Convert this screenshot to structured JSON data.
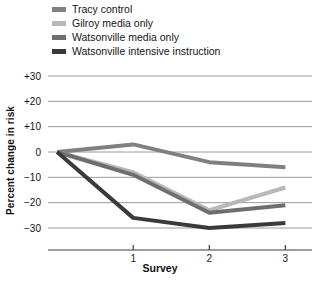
{
  "chart_data": {
    "type": "line",
    "title": "",
    "xlabel": "Survey",
    "ylabel": "Percent change in risk",
    "x": [
      0,
      1,
      2,
      3
    ],
    "xticklabels": [
      "",
      "1",
      "2",
      "3"
    ],
    "yticklabels": [
      "+30",
      "+20",
      "+10",
      "0",
      "-10",
      "-20",
      "-30"
    ],
    "yticks": [
      30,
      20,
      10,
      0,
      -10,
      -20,
      -30
    ],
    "ylim": [
      -35,
      33
    ],
    "xlim": [
      -0.12,
      3.35
    ],
    "grid": "horizontal",
    "legend_position": "above-plot-left",
    "series": [
      {
        "name": "Tracy control",
        "color": "#808080",
        "values": [
          0,
          3,
          -4,
          -6
        ]
      },
      {
        "name": "Gilroy media only",
        "color": "#b8b8b8",
        "values": [
          0,
          -8,
          -23,
          -14
        ]
      },
      {
        "name": "Watsonville media only",
        "color": "#6e6e6e",
        "values": [
          0,
          -9,
          -24,
          -21
        ]
      },
      {
        "name": "Watsonville intensive instruction",
        "color": "#3a3a3a",
        "values": [
          0,
          -26,
          -30,
          -28
        ]
      }
    ]
  },
  "legend": {
    "items": [
      {
        "label": "Tracy control",
        "color": "#808080"
      },
      {
        "label": "Gilroy media only",
        "color": "#b8b8b8"
      },
      {
        "label": "Watsonville media only",
        "color": "#6e6e6e"
      },
      {
        "label": "Watsonville intensive instruction",
        "color": "#3a3a3a"
      }
    ]
  },
  "axes": {
    "y_title": "Percent change in risk",
    "x_title": "Survey"
  },
  "style": {
    "gridline_color": "#9a9a9a",
    "axis_color": "#3d3d3d",
    "background": "#ffffff"
  }
}
